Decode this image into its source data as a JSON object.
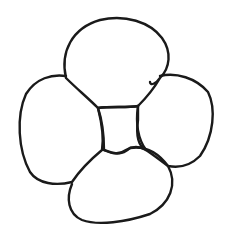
{
  "drawing": {
    "subject": "four-petal flower sketch",
    "stroke_color": "#1a1a1a",
    "background": "#ffffff",
    "petals": [
      "top",
      "right",
      "left",
      "bottom"
    ],
    "center": "square"
  }
}
